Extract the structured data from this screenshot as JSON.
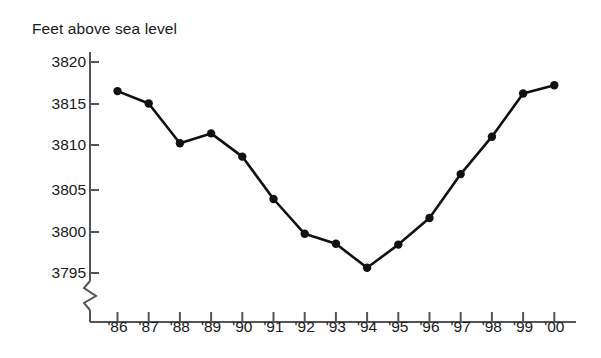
{
  "chart_data": {
    "type": "line",
    "title": "Feet above sea level",
    "xlabel": "",
    "ylabel": "Feet above sea level",
    "categories": [
      "'86",
      "'87",
      "'88",
      "'89",
      "'90",
      "'91",
      "'92",
      "'93",
      "'94",
      "'95",
      "'96",
      "'97",
      "'98",
      "'99",
      "'00"
    ],
    "values": [
      3816.5,
      3815.0,
      3810.2,
      3811.4,
      3808.6,
      3803.5,
      3799.3,
      3798.1,
      3795.2,
      3798.0,
      3801.2,
      3806.5,
      3811.0,
      3816.2,
      3817.2
    ],
    "series": [
      {
        "name": "Feet above sea level",
        "values": [
          3816.5,
          3815.0,
          3810.2,
          3811.4,
          3808.6,
          3803.5,
          3799.3,
          3798.1,
          3795.2,
          3798.0,
          3801.2,
          3806.5,
          3811.0,
          3816.2,
          3817.2
        ]
      }
    ],
    "ytick_labels": [
      "3820",
      "3815",
      "3810",
      "3805",
      "3800",
      "3795"
    ],
    "ytick_values": [
      3820,
      3815,
      3810,
      3805,
      3800,
      3795
    ],
    "ylim": [
      3795,
      3820
    ],
    "axis_break": true,
    "grid": false,
    "legend": "none",
    "marker": "filled-circle",
    "line_color": "#111111",
    "marker_color": "#111111",
    "axis_color": "#555555",
    "text_color": "#1a1a1a"
  },
  "axis": {
    "title": "Feet above sea level"
  }
}
